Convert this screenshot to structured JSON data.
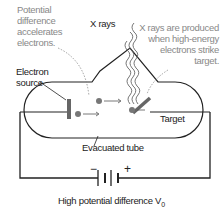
{
  "labels": {
    "potential_diff": [
      "Potential",
      "difference",
      "accelerates",
      "electrons."
    ],
    "xrays": "X rays",
    "xrays_produced": [
      "X rays are produced",
      "when high-energy",
      "electrons strike",
      "target."
    ],
    "electron_source": [
      "Electron",
      "source"
    ],
    "target": "Target",
    "evacuated_tube": "Evacuated tube",
    "high_potential": "High potential difference V",
    "high_potential_sub": "0",
    "minus": "−",
    "plus": "+"
  },
  "colors": {
    "line": "#222222",
    "annotation": "#888888",
    "electron": "#777777",
    "target": "#666666"
  }
}
